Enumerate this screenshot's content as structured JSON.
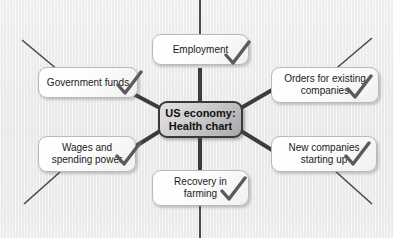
{
  "diagram": {
    "type": "mind-map",
    "title": "US economy: Health chart",
    "background_color": "#ebebec",
    "center": {
      "label": "US economy:\nHealth chart",
      "fill_from": "#e2e2e3",
      "fill_to": "#a9a9ab",
      "border_color": "#3a3a3c"
    },
    "branch_color": "#3c3c3e",
    "spoke_color": "#4a4a4c",
    "check_color": "#5b5b5d",
    "nodes": [
      {
        "id": "employment",
        "label": "Employment",
        "checked": true
      },
      {
        "id": "orders",
        "label": "Orders for existing\ncompanies",
        "checked": true
      },
      {
        "id": "new-companies",
        "label": "New companies\nstarting up",
        "checked": true
      },
      {
        "id": "recovery-farming",
        "label": "Recovery in\nfarming",
        "checked": true
      },
      {
        "id": "wages",
        "label": "Wages and\nspending power",
        "checked": true
      },
      {
        "id": "government-funds",
        "label": "Government funds",
        "checked": true
      }
    ]
  }
}
